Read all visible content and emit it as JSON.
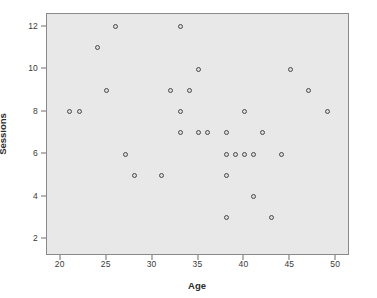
{
  "chart_data": {
    "type": "scatter",
    "title": "",
    "xlabel": "Age",
    "ylabel": "Sessions",
    "xlim": [
      18.5,
      51.5
    ],
    "ylim": [
      1.2,
      12.6
    ],
    "xticks": [
      20,
      25,
      30,
      35,
      40,
      45,
      50
    ],
    "yticks": [
      2,
      4,
      6,
      8,
      10,
      12
    ],
    "grid": false,
    "legend": null,
    "marker": "open-circle",
    "point_color": "#4a4a4a",
    "plot_background": "#e8e8e8",
    "x": [
      21,
      22,
      24,
      25,
      26,
      27,
      28,
      31,
      32,
      33,
      33,
      33,
      34,
      35,
      35,
      36,
      38,
      38,
      38,
      38,
      39,
      40,
      40,
      41,
      41,
      42,
      43,
      44,
      45,
      47,
      49
    ],
    "y": [
      8,
      8,
      11,
      9,
      12,
      6,
      5,
      5,
      9,
      12,
      8,
      7,
      9,
      10,
      7,
      7,
      7,
      6,
      5,
      3,
      6,
      8,
      6,
      6,
      4,
      7,
      3,
      6,
      10,
      9,
      8
    ],
    "points": [
      {
        "age": 21,
        "sessions": 8
      },
      {
        "age": 22,
        "sessions": 8
      },
      {
        "age": 24,
        "sessions": 11
      },
      {
        "age": 25,
        "sessions": 9
      },
      {
        "age": 26,
        "sessions": 12
      },
      {
        "age": 27,
        "sessions": 6
      },
      {
        "age": 28,
        "sessions": 5
      },
      {
        "age": 31,
        "sessions": 5
      },
      {
        "age": 32,
        "sessions": 9
      },
      {
        "age": 33,
        "sessions": 12
      },
      {
        "age": 33,
        "sessions": 8
      },
      {
        "age": 33,
        "sessions": 7
      },
      {
        "age": 34,
        "sessions": 9
      },
      {
        "age": 35,
        "sessions": 10
      },
      {
        "age": 35,
        "sessions": 7
      },
      {
        "age": 36,
        "sessions": 7
      },
      {
        "age": 38,
        "sessions": 7
      },
      {
        "age": 38,
        "sessions": 6
      },
      {
        "age": 38,
        "sessions": 5
      },
      {
        "age": 38,
        "sessions": 3
      },
      {
        "age": 39,
        "sessions": 6
      },
      {
        "age": 40,
        "sessions": 8
      },
      {
        "age": 40,
        "sessions": 6
      },
      {
        "age": 41,
        "sessions": 6
      },
      {
        "age": 41,
        "sessions": 4
      },
      {
        "age": 42,
        "sessions": 7
      },
      {
        "age": 43,
        "sessions": 3
      },
      {
        "age": 44,
        "sessions": 6
      },
      {
        "age": 45,
        "sessions": 10
      },
      {
        "age": 47,
        "sessions": 9
      },
      {
        "age": 49,
        "sessions": 8
      }
    ]
  },
  "axes": {
    "y_axis_title": "Sessions",
    "x_axis_title": "Age",
    "y_tick_labels": [
      "12",
      "10",
      "8",
      "6",
      "4",
      "2"
    ],
    "x_tick_labels": [
      "20",
      "25",
      "30",
      "35",
      "40",
      "45",
      "50"
    ]
  }
}
